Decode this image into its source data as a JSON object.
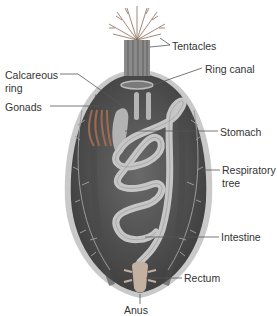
{
  "figure": {
    "colors": {
      "body": "#5a5a5a",
      "body_dark": "#3e3e3e",
      "rim": "#bdbdbd",
      "organ": "#b8b8b8",
      "leader": "#555555",
      "text": "#333333"
    }
  },
  "labels": {
    "tentacles": "Tentacles",
    "ring_canal": "Ring canal",
    "calcareous_ring_1": "Calcareous",
    "calcareous_ring_2": "ring",
    "gonads": "Gonads",
    "stomach": "Stomach",
    "respiratory_tree_1": "Respiratory",
    "respiratory_tree_2": "tree",
    "intestine": "Intestine",
    "rectum": "Rectum",
    "anus": "Anus"
  }
}
